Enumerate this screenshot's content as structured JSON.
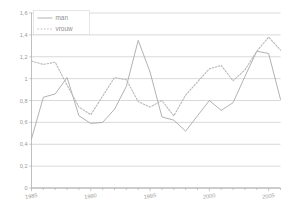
{
  "chart_data": {
    "type": "line",
    "title": "",
    "xlabel": "",
    "ylabel": "",
    "xlim": [
      1985,
      2006
    ],
    "ylim": [
      0,
      1.6
    ],
    "grid": true,
    "legend_position": "top-left",
    "y_ticks": [
      0,
      0.2,
      0.4,
      0.6,
      0.8,
      1.0,
      1.2,
      1.4,
      1.6
    ],
    "y_tick_labels": [
      "0",
      "0,2",
      "0,4",
      "0,6",
      "0,8",
      "1",
      "1,2",
      "1,4",
      "1,6"
    ],
    "x_ticks": [
      1985,
      1990,
      1995,
      2000,
      2005
    ],
    "x_tick_labels": [
      "1985",
      "1990",
      "1995",
      "2000",
      "2005"
    ],
    "x_minor_ticks": [
      1986,
      1987,
      1988,
      1989,
      1991,
      1992,
      1993,
      1994,
      1996,
      1997,
      1998,
      1999,
      2001,
      2002,
      2003,
      2004,
      2006
    ],
    "x": [
      1985,
      1986,
      1987,
      1988,
      1989,
      1990,
      1991,
      1992,
      1993,
      1994,
      1995,
      1996,
      1997,
      1998,
      1999,
      2000,
      2001,
      2002,
      2003,
      2004,
      2005,
      2006
    ],
    "series": [
      {
        "name": "man",
        "style": "solid",
        "color": "#a9a9a9",
        "values": [
          0.45,
          0.83,
          0.86,
          1.01,
          0.66,
          0.59,
          0.6,
          0.72,
          0.93,
          1.35,
          1.06,
          0.65,
          0.62,
          0.52,
          0.66,
          0.8,
          0.71,
          0.78,
          1.02,
          1.25,
          1.23,
          0.81
        ]
      },
      {
        "name": "vrouw",
        "style": "dotted",
        "color": "#b9b9b9",
        "values": [
          1.16,
          1.13,
          1.15,
          0.94,
          0.74,
          0.67,
          0.84,
          1.01,
          0.99,
          0.79,
          0.74,
          0.8,
          0.66,
          0.85,
          0.97,
          1.09,
          1.12,
          0.98,
          1.08,
          1.25,
          1.38,
          1.26
        ]
      }
    ]
  },
  "legend": {
    "items": [
      {
        "label": "man",
        "style": "solid"
      },
      {
        "label": "vrouw",
        "style": "dotted"
      }
    ]
  },
  "colors": {
    "grid": "#c8c8c8",
    "axis": "#b0b0b0",
    "man_line": "#a9a9a9",
    "vrouw_line": "#bdbdbd",
    "tick_label": "#9a9a9a",
    "background": "#ffffff"
  }
}
